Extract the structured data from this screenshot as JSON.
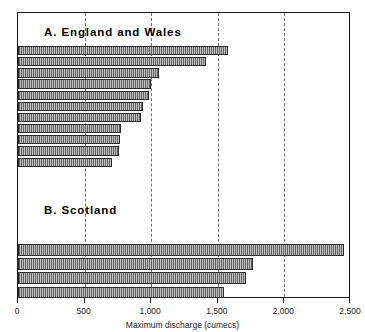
{
  "chart_data": {
    "type": "bar",
    "orientation": "horizontal",
    "title": "",
    "xlabel": "Maximum discharge (cumecs)",
    "ylabel": "",
    "xlim": [
      0,
      2500
    ],
    "xticks": [
      0,
      500,
      1000,
      1500,
      2000,
      2500
    ],
    "xticklabels": [
      "0",
      "500",
      "1,000",
      "1,500",
      "2,000",
      "2,500"
    ],
    "grid": "vertical dashed at 500, 1,000, 1,500, 2,000",
    "legend": "none",
    "panels": [
      {
        "label": "A.",
        "name": "England and Wales",
        "caption": "A.  England  and  Wales",
        "categories": [
          "1",
          "2",
          "3",
          "4",
          "5",
          "6",
          "7",
          "8",
          "9",
          "10",
          "11"
        ],
        "values": [
          1580,
          1410,
          1055,
          995,
          985,
          935,
          925,
          770,
          765,
          760,
          705
        ]
      },
      {
        "label": "B.",
        "name": "Scotland",
        "caption": "B.  Scotland",
        "categories": [
          "1",
          "2",
          "3",
          "4"
        ],
        "values": [
          2445,
          1765,
          1710,
          1545
        ]
      }
    ]
  },
  "axis": {
    "title": "Maximum discharge (cumecs)",
    "tick_labels": [
      "0",
      "500",
      "1,000",
      "1,500",
      "2,000",
      "2,500"
    ]
  },
  "captions": {
    "a": "A.  England  and  Wales",
    "b": "B.  Scotland"
  },
  "colors": {
    "bar_fill": "#8f8f8f",
    "bar_edge": "#2b2b2b",
    "frame": "#1a1a1a",
    "gridline": "#6e6e6e",
    "background": "#ffffff"
  }
}
